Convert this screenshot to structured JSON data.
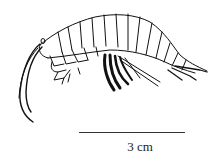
{
  "figure": {
    "colors": {
      "line": "#111111",
      "background": "#ffffff"
    }
  },
  "scale": {
    "label": "3 cm"
  }
}
